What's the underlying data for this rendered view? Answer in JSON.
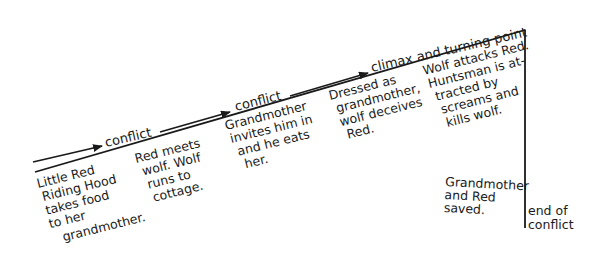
{
  "diagram": {
    "stage_labels": [
      {
        "id": "conflict-1",
        "text": "conflict"
      },
      {
        "id": "conflict-2",
        "text": "conflict"
      },
      {
        "id": "climax",
        "text": "climax and turning point"
      }
    ],
    "events": [
      {
        "id": "event-1",
        "lines": [
          "Little Red",
          "Riding Hood",
          "takes food",
          "to her",
          "grandmother."
        ]
      },
      {
        "id": "event-2",
        "lines": [
          "Red meets",
          "wolf. Wolf",
          "runs to",
          "cottage."
        ]
      },
      {
        "id": "event-3",
        "lines": [
          "Grandmother",
          "invites him in",
          "and he eats",
          "her."
        ]
      },
      {
        "id": "event-4",
        "lines": [
          "Dressed as",
          "grandmother,",
          "wolf deceives",
          "Red."
        ]
      },
      {
        "id": "event-5",
        "lines": [
          "Wolf attacks Red.",
          "Huntsman is at-",
          "tracted by",
          "screams and",
          "kills wolf."
        ]
      },
      {
        "id": "event-6",
        "lines": [
          "Grandmother",
          "and Red",
          "saved."
        ]
      }
    ],
    "end_label": {
      "lines": [
        "end of",
        "conflict"
      ]
    },
    "colors": {
      "ink": "#1a1a1a",
      "background": "#ffffff"
    }
  }
}
